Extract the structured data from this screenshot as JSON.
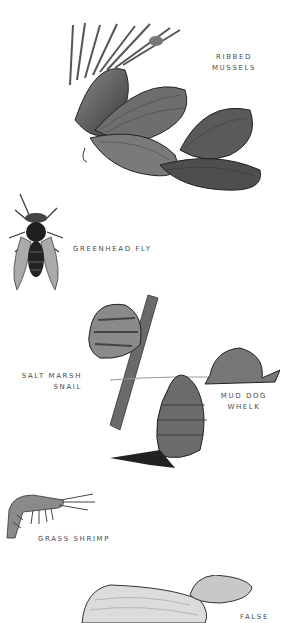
{
  "page": {
    "background": "#ffffff",
    "label_color": "#4a4a4a"
  },
  "species": [
    {
      "id": "ribbed-mussels",
      "lines": [
        "RIBBED",
        "MUSSELS"
      ]
    },
    {
      "id": "greenhead-fly",
      "lines": [
        "GREENHEAD FLY"
      ]
    },
    {
      "id": "salt-marsh-snail",
      "lines": [
        "SALT MARSH",
        "SNAIL"
      ]
    },
    {
      "id": "mud-dog-whelk",
      "lines": [
        "MUD DOG",
        "WHELK"
      ]
    },
    {
      "id": "grass-shrimp",
      "lines": [
        "GRASS SHRIMP"
      ]
    },
    {
      "id": "false",
      "lines": [
        "FALSE"
      ]
    }
  ]
}
